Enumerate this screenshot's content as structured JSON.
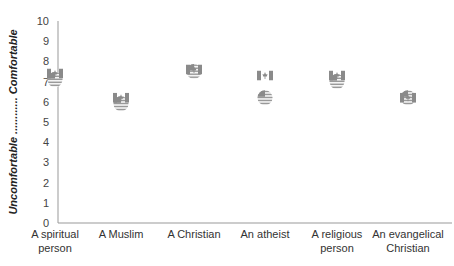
{
  "chart_data": {
    "type": "scatter",
    "title": "",
    "xlabel": "",
    "ylabel": "Uncomfortable ............ Comfortable",
    "ylabel_low": "Uncomfortable",
    "ylabel_high": "Comfortable",
    "ylim": [
      0,
      10
    ],
    "yticks": [
      0,
      1,
      2,
      3,
      4,
      5,
      6,
      7,
      8,
      9,
      10
    ],
    "grid": false,
    "legend": "none (markers are flag icons: Canada flag and US flag)",
    "categories": [
      [
        "A spiritual",
        "person"
      ],
      [
        "A Muslim"
      ],
      [
        "A Christian"
      ],
      [
        "An atheist"
      ],
      [
        "A religious",
        "person"
      ],
      [
        "An evangelical",
        "Christian"
      ]
    ],
    "series": [
      {
        "name": "Canada",
        "marker": "canada-flag",
        "values": [
          7.4,
          6.2,
          7.6,
          7.3,
          7.3,
          6.2
        ]
      },
      {
        "name": "United States",
        "marker": "us-flag",
        "values": [
          7.1,
          5.9,
          7.5,
          6.2,
          7.0,
          6.2
        ]
      }
    ]
  },
  "colors": {
    "axis": "#999999",
    "marker": "#9a9a9a",
    "text": "#333333"
  }
}
